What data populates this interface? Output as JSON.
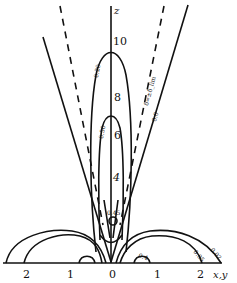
{
  "figure": {
    "axis_z": {
      "label": "z",
      "ticks": [
        "10",
        "8",
        "6",
        "4"
      ]
    },
    "axis_xy": {
      "label": "x,y",
      "ticks": [
        "2",
        "1",
        "0",
        "1",
        "2"
      ]
    },
    "contour_labels": {
      "outer_tall": "0.20",
      "inner_tall": "0.50",
      "near_base": "0.45",
      "right_lobe_outer": "0.02",
      "right_lobe_inner": "0.05",
      "right_small": "0.4",
      "boundary_line": "0.0",
      "dashed_line": "δ=±δ_lim"
    },
    "colors": {
      "ink": "#111111",
      "background": "#ffffff"
    }
  }
}
